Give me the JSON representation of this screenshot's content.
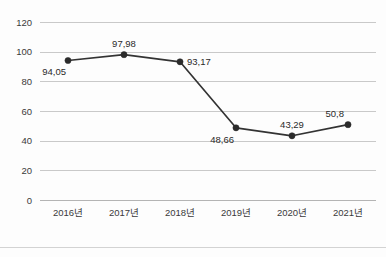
{
  "corner_note": {
    "text": ""
  },
  "chart_data": {
    "type": "line",
    "title": "",
    "subtitle": "",
    "xlabel": "",
    "ylabel": "",
    "categories": [
      "2016년",
      "2017년",
      "2018년",
      "2019년",
      "2020년",
      "2021년"
    ],
    "values": [
      94.05,
      97.98,
      93.17,
      48.66,
      43.29,
      50.8
    ],
    "point_labels": [
      "94,05",
      "97,98",
      "93,17",
      "48,66",
      "43,29",
      "50,8"
    ],
    "label_positions": [
      "below-left",
      "above",
      "right",
      "below-left",
      "above",
      "above-left"
    ],
    "ylim": [
      0,
      120
    ],
    "yticks": [
      0,
      20,
      40,
      60,
      80,
      100,
      120
    ],
    "ytick_labels": [
      "0",
      "20",
      "40",
      "60",
      "80",
      "100",
      "120"
    ],
    "grid": true,
    "grid_axis": "y",
    "legend": false,
    "legend_position": "none",
    "series_color": "#333333",
    "marker": "circle",
    "decimal_separator": ","
  },
  "colors": {
    "background": "#fdfdfd",
    "gridline": "#c9c9c9",
    "axis": "#b4b4b4",
    "line": "#333333",
    "marker": "#2b2b2b",
    "tick_text": "#3a3a3a",
    "label_text": "#2a2a2a",
    "footer_divider": "#d3d3d3"
  }
}
